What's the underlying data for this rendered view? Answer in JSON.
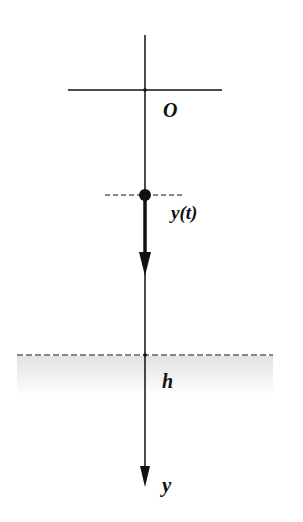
{
  "diagram": {
    "labels": {
      "origin": "O",
      "position": "y(t)",
      "height": "h",
      "axis": "y"
    },
    "colors": {
      "line": "#111111",
      "ground_shade": "#e6e6e6",
      "background": "#ffffff"
    }
  }
}
